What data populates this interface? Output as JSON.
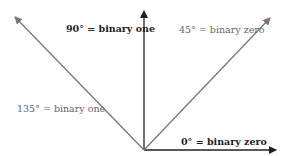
{
  "diagram": {
    "colors": {
      "dark": "#222222",
      "gray": "#777777"
    },
    "vectors": [
      {
        "id": "0deg",
        "angle_deg": 0,
        "label": "0° = binary zero",
        "emphasis": "dark",
        "bold": true
      },
      {
        "id": "45deg",
        "angle_deg": 45,
        "label": "45° = binary zero",
        "emphasis": "gray",
        "bold": false
      },
      {
        "id": "90deg",
        "angle_deg": 90,
        "label": "90° = binary one",
        "emphasis": "dark",
        "bold": true
      },
      {
        "id": "135deg",
        "angle_deg": 135,
        "label": "135° = binary one",
        "emphasis": "gray",
        "bold": false
      }
    ]
  }
}
